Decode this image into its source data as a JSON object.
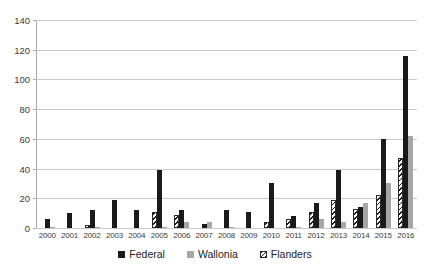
{
  "chart_data": {
    "type": "bar",
    "title": "",
    "subtitle": "",
    "xlabel": "",
    "ylabel": "",
    "ylim": [
      0,
      140
    ],
    "ytick_step": 20,
    "yticks": [
      0,
      20,
      40,
      60,
      80,
      100,
      120,
      140
    ],
    "grid": "horizontal",
    "legend_position": "bottom-center",
    "categories": [
      "2000",
      "2001",
      "2002",
      "2003",
      "2004",
      "2005",
      "2006",
      "2007",
      "2008",
      "2009",
      "2010",
      "2011",
      "2012",
      "2013",
      "2014",
      "2015",
      "2016"
    ],
    "series": [
      {
        "name": "Federal",
        "color": "#1a1a1a",
        "pattern": "solid",
        "values": [
          6,
          10,
          12,
          19,
          12,
          39,
          12,
          3,
          12,
          11,
          30,
          8,
          17,
          39,
          14,
          60,
          116
        ]
      },
      {
        "name": "Wallonia",
        "color": "#a6a6a6",
        "pattern": "solid",
        "values": [
          1,
          0,
          1,
          0,
          0,
          1,
          4,
          4,
          1,
          0,
          0,
          1,
          6,
          4,
          17,
          30,
          62
        ]
      },
      {
        "name": "Flanders",
        "color": "#1a1a1a",
        "pattern": "diagonal-hatch",
        "values": [
          0,
          0,
          2,
          0,
          0,
          11,
          9,
          0,
          0,
          0,
          4,
          6,
          11,
          19,
          13,
          22,
          47
        ]
      }
    ]
  },
  "legend": {
    "items": [
      {
        "label": "Federal",
        "key": "federal"
      },
      {
        "label": "Wallonia",
        "key": "wallonia"
      },
      {
        "label": "Flanders",
        "key": "flanders"
      }
    ]
  },
  "colors": {
    "federal": "#1a1a1a",
    "wallonia": "#a6a6a6",
    "flanders": "#1a1a1a",
    "gridline": "#c8c8c8",
    "axis": "#a8a8a8",
    "background": "#ffffff"
  }
}
